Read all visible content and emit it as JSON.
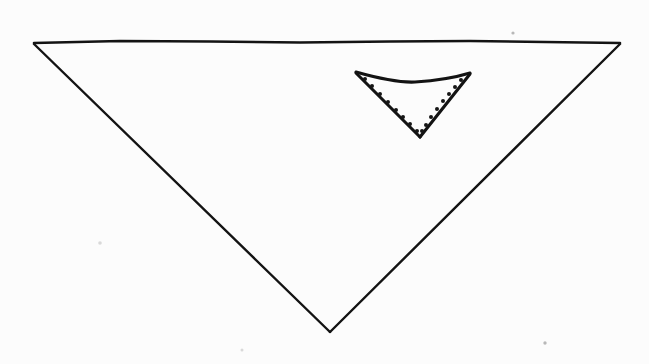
{
  "figure": {
    "background_color": "#fcfcfc",
    "ink_color": "#131313",
    "canvas": {
      "width": 649,
      "height": 364
    },
    "shapes": {
      "outer_triangle": {
        "name": "outer-inverted-triangle",
        "orientation": "apex-down",
        "vertices": [
          {
            "label": "top-left",
            "x": 34,
            "y": 43
          },
          {
            "label": "top-right",
            "x": 620,
            "y": 43
          },
          {
            "label": "bottom-apex",
            "x": 330,
            "y": 332
          }
        ],
        "top_edge_path": "M34,43 L120,41 L210,41.5 L300,42.5 L390,41.5 L470,41 L545,42 L620,43",
        "left_edge_path": "M34,44 L330,332",
        "right_edge_path": "M620,44 L330,332",
        "stroke_width": 2.4,
        "style": "solid"
      },
      "inner_triangle": {
        "name": "inner-inverted-triangle",
        "orientation": "apex-down",
        "vertices": [
          {
            "label": "top-left",
            "x": 356,
            "y": 72
          },
          {
            "label": "top-right",
            "x": 470,
            "y": 73
          },
          {
            "label": "bottom-apex",
            "x": 420,
            "y": 137
          }
        ],
        "top_edge_path": "M356,72 Q395,83 415,82 Q447,80 470,73",
        "left_edge_path": "M356,73 L420,137",
        "right_edge_path": "M470,74 L420,137",
        "stroke_width": 3.1,
        "style": "solid"
      },
      "dotted_line": {
        "name": "inner-dotted-outline",
        "style": "dotted",
        "dot_radius": 2.0,
        "dot_color": "#161616",
        "left_side_dots": [
          {
            "x": 365,
            "y": 79
          },
          {
            "x": 372,
            "y": 86
          },
          {
            "x": 380,
            "y": 94
          },
          {
            "x": 388,
            "y": 102
          },
          {
            "x": 396,
            "y": 110
          },
          {
            "x": 403,
            "y": 117
          },
          {
            "x": 410,
            "y": 124
          },
          {
            "x": 417,
            "y": 131
          }
        ],
        "right_side_dots": [
          {
            "x": 461,
            "y": 80
          },
          {
            "x": 455,
            "y": 87
          },
          {
            "x": 449,
            "y": 94
          },
          {
            "x": 443,
            "y": 101
          },
          {
            "x": 437,
            "y": 109
          },
          {
            "x": 431,
            "y": 117
          },
          {
            "x": 426,
            "y": 125
          },
          {
            "x": 422,
            "y": 131
          }
        ]
      }
    },
    "specks": [
      {
        "name": "speck-top-right",
        "x": 513,
        "y": 33,
        "r": 1.6,
        "tone": "dark"
      },
      {
        "name": "speck-left-mid",
        "x": 100,
        "y": 243,
        "r": 1.8,
        "tone": "light"
      },
      {
        "name": "speck-bottom-right",
        "x": 545,
        "y": 343,
        "r": 1.7,
        "tone": "dark"
      },
      {
        "name": "speck-bottom-left",
        "x": 242,
        "y": 350,
        "r": 1.5,
        "tone": "light"
      }
    ]
  }
}
